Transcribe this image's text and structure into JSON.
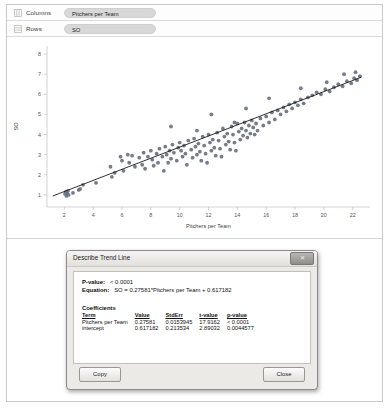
{
  "shelves": [
    {
      "icon": "columns-grid-icon",
      "label": "Columns",
      "pill": "Pitchers per Team"
    },
    {
      "icon": "rows-grid-icon",
      "label": "Rows",
      "pill": "SO"
    }
  ],
  "chart_data": {
    "type": "scatter",
    "title": "",
    "xlabel": "Pitchers per Team",
    "ylabel": "SO",
    "xlim": [
      0.8,
      23.2
    ],
    "ylim": [
      0.4,
      8.4
    ],
    "xticks": [
      2,
      4,
      6,
      8,
      10,
      12,
      14,
      16,
      18,
      20,
      22
    ],
    "yticks": [
      1,
      2,
      3,
      4,
      5,
      6,
      7,
      8
    ],
    "grid": false,
    "point_color": "#6a7280",
    "trendline_color": "#1a1a1a",
    "trendline": {
      "slope": 0.27581,
      "intercept": 0.617182,
      "x_start": 1.2,
      "x_end": 22.6,
      "equation": "SO = 0.27581*Pitchers per Team + 0.617182"
    },
    "series": [
      {
        "name": "SO vs Pitchers per Team",
        "x": [
          2.05,
          2.1,
          2.15,
          2.2,
          2.25,
          2.3,
          2.6,
          3.0,
          3.1,
          3.3,
          4.2,
          5.2,
          5.3,
          5.5,
          5.9,
          6.0,
          6.1,
          6.4,
          6.5,
          6.7,
          6.9,
          7.2,
          7.4,
          7.5,
          7.6,
          7.8,
          8.0,
          8.1,
          8.2,
          8.4,
          8.5,
          8.6,
          8.8,
          8.9,
          9.0,
          9.1,
          9.2,
          9.3,
          9.4,
          9.5,
          9.6,
          9.8,
          9.9,
          10.0,
          10.1,
          10.2,
          10.3,
          10.4,
          10.5,
          10.6,
          10.8,
          10.9,
          11.0,
          11.1,
          11.2,
          11.3,
          11.4,
          11.5,
          11.6,
          11.7,
          11.8,
          11.9,
          12.0,
          12.1,
          12.2,
          12.3,
          12.4,
          12.5,
          12.6,
          12.7,
          12.8,
          12.9,
          13.0,
          13.1,
          13.2,
          13.3,
          13.4,
          13.5,
          13.6,
          13.7,
          13.8,
          13.9,
          14.0,
          14.1,
          14.2,
          14.3,
          14.4,
          14.5,
          14.6,
          14.7,
          14.8,
          14.9,
          15.0,
          15.1,
          15.2,
          15.3,
          15.4,
          15.6,
          15.8,
          16.0,
          16.2,
          16.4,
          16.6,
          16.8,
          17.0,
          17.2,
          17.4,
          17.6,
          17.8,
          18.0,
          18.2,
          18.4,
          18.6,
          18.9,
          19.2,
          19.5,
          19.8,
          20.1,
          20.4,
          20.7,
          21.0,
          21.3,
          21.6,
          21.9,
          22.1,
          22.3,
          22.5,
          12.2,
          13.8,
          9.4,
          11.2,
          14.6,
          16.2,
          18.4,
          20.2,
          21.4,
          22.2
        ],
        "y": [
          1.05,
          1.15,
          0.95,
          1.1,
          1.2,
          1.0,
          1.1,
          1.25,
          1.3,
          1.5,
          1.6,
          2.4,
          1.9,
          2.1,
          2.9,
          2.7,
          2.2,
          3.0,
          2.6,
          2.95,
          2.4,
          2.85,
          2.5,
          3.1,
          2.3,
          2.9,
          3.2,
          2.75,
          2.45,
          3.05,
          2.6,
          3.3,
          2.9,
          2.2,
          3.4,
          3.0,
          2.6,
          3.2,
          2.8,
          3.5,
          3.1,
          2.7,
          3.35,
          3.6,
          3.2,
          2.9,
          3.45,
          3.05,
          2.5,
          3.7,
          3.25,
          2.85,
          3.8,
          3.4,
          3.0,
          3.55,
          3.15,
          2.7,
          3.9,
          3.45,
          3.05,
          2.6,
          4.0,
          3.6,
          3.2,
          3.75,
          3.35,
          2.95,
          4.1,
          3.7,
          3.3,
          2.9,
          4.3,
          3.9,
          3.5,
          4.05,
          3.65,
          3.25,
          4.4,
          4.0,
          3.6,
          3.2,
          4.55,
          4.15,
          3.75,
          4.3,
          3.95,
          4.6,
          4.2,
          3.85,
          4.45,
          4.05,
          4.7,
          4.35,
          4.0,
          4.55,
          4.2,
          4.8,
          4.45,
          4.9,
          4.6,
          5.1,
          4.75,
          5.2,
          5.0,
          5.35,
          5.15,
          5.5,
          5.3,
          5.6,
          5.45,
          5.75,
          5.55,
          5.85,
          5.95,
          6.1,
          6.0,
          6.25,
          6.15,
          6.35,
          6.5,
          6.4,
          6.65,
          6.55,
          6.8,
          6.7,
          6.9,
          5.0,
          4.6,
          4.4,
          4.2,
          5.3,
          5.8,
          6.3,
          6.6,
          7.0,
          7.1
        ]
      }
    ]
  },
  "dialog": {
    "title": "Describe Trend Line",
    "close_icon": "window-close-icon",
    "p_value_label": "P-value:",
    "p_value": "< 0.0001",
    "equation_label": "Equation:",
    "equation": "SO = 0.27581*Pitchers per Team + 0.617182",
    "coefficients_heading": "Coefficients",
    "columns": [
      "Term",
      "Value",
      "StdErr",
      "t-value",
      "p-value"
    ],
    "rows": [
      [
        "Pitchers per Team",
        "0.27581",
        "0.0153945",
        "17.9162",
        "< 0.0001"
      ],
      [
        "intercept",
        "0.617182",
        "0.213534",
        "2.89032",
        "0.0044577"
      ]
    ],
    "copy_label": "Copy",
    "close_label": "Close"
  }
}
